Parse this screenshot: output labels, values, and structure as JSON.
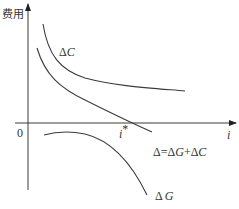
{
  "diagram": {
    "y_axis_label": "费用",
    "x_axis_label": "i",
    "origin_label": "0",
    "optimum_label": "i",
    "optimum_superscript": "*",
    "curves": [
      {
        "name": "delta-c-curve",
        "label_delta": "Δ",
        "label_var": "C",
        "description": "decreasing convex curve above x-axis"
      },
      {
        "name": "delta-total-curve",
        "label": "Δ=ΔG+ΔC",
        "description": "decreasing curve crossing x-axis at i*"
      },
      {
        "name": "delta-g-curve",
        "label_delta": "Δ",
        "label_var": "G",
        "description": "negative decreasing curve below x-axis"
      }
    ],
    "total_label_parts": {
      "d1": "Δ=Δ",
      "g": "G",
      "plus": "+Δ",
      "c": "C"
    }
  }
}
